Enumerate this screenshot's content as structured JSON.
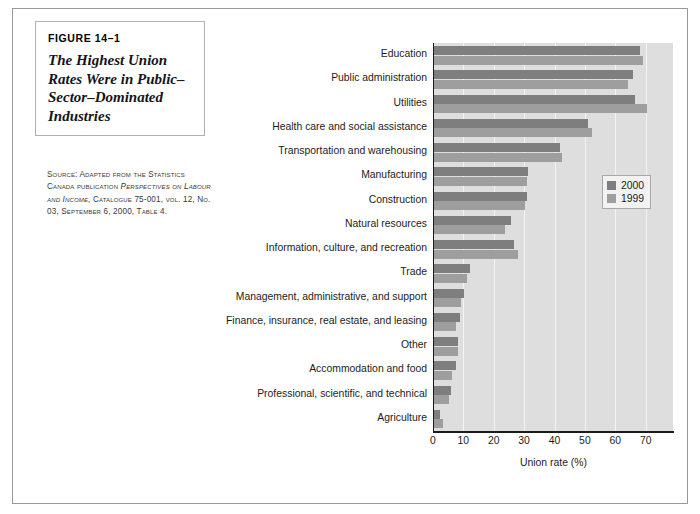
{
  "figure": {
    "number": "FIGURE 14–1",
    "title": "The Highest Union Rates Were in Public–Sector–Dominated Industries",
    "source_prefix": "Source: Adapted from the Statistics Canada publication ",
    "source_italic_1": "Perspectives on Labour and Income",
    "source_middle": ", Catalogue 75-001, vol. 12, No. 03, September 6, 2000, Table 4."
  },
  "chart_data": {
    "type": "bar",
    "orientation": "horizontal",
    "title": "",
    "xlabel": "Union rate (%)",
    "ylabel": "",
    "xlim": [
      0,
      79
    ],
    "xticks": [
      0,
      10,
      20,
      30,
      40,
      50,
      60,
      70
    ],
    "grid": true,
    "legend_position": "right",
    "categories": [
      "Education",
      "Public administration",
      "Utilities",
      "Health care and social assistance",
      "Transportation and warehousing",
      "Manufacturing",
      "Construction",
      "Natural resources",
      "Information, culture, and recreation",
      "Trade",
      "Management, administrative, and support",
      "Finance, insurance, real estate, and leasing",
      "Other",
      "Accommodation and food",
      "Professional, scientific, and technical",
      "Agriculture"
    ],
    "series": [
      {
        "name": "2000",
        "color": "#7e7e7e",
        "values": [
          67.7,
          65.4,
          66.0,
          50.6,
          41.4,
          31.0,
          30.6,
          25.5,
          26.4,
          12.0,
          9.9,
          8.5,
          8.0,
          7.1,
          5.6,
          2.1
        ]
      },
      {
        "name": "1999",
        "color": "#9e9e9e",
        "values": [
          68.7,
          64.0,
          70.0,
          52.0,
          42.0,
          30.5,
          30.0,
          23.5,
          27.5,
          11.0,
          8.8,
          7.3,
          7.8,
          6.0,
          4.8,
          2.8
        ]
      }
    ]
  }
}
